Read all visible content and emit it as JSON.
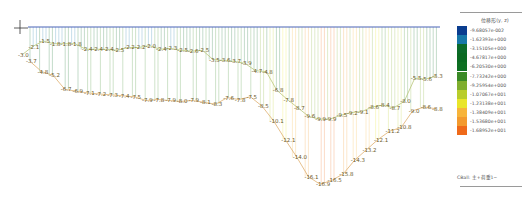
{
  "view": {
    "type": "structural-analysis-contour",
    "description": "Deformed shape / displacement diagram with value labels"
  },
  "legend": {
    "title": "位移形(y, z)",
    "entries": [
      {
        "value": "-9.68057e-002",
        "color": "#0a3d8f"
      },
      {
        "value": "-1.62393e+000",
        "color": "#1778a8"
      },
      {
        "value": "-3.15105e+000",
        "color": "#0b6b2a"
      },
      {
        "value": "-4.67817e+000",
        "color": "#0a6a22"
      },
      {
        "value": "-6.20530e+000",
        "color": "#0d6f22"
      },
      {
        "value": "-7.73242e+000",
        "color": "#3a8a26"
      },
      {
        "value": "-9.25954e+000",
        "color": "#7fae2e"
      },
      {
        "value": "-1.07067e+001",
        "color": "#b9cd2a"
      },
      {
        "value": "-1.23138e+001",
        "color": "#e9e52a"
      },
      {
        "value": "-1.38409e+001",
        "color": "#f7b43a"
      },
      {
        "value": "-1.53680e+001",
        "color": "#f39a2e"
      },
      {
        "value": "-1.68952e+001",
        "color": "#ef6a1a"
      }
    ],
    "footer": "CBall: 主+荷重1~"
  },
  "upper_curve_labels": [
    "-3.0",
    "-2.1",
    "-1.5",
    "-1.8",
    "-1.8",
    "-1.8",
    "-2.4",
    "-2.4",
    "-2.4",
    "-2.5",
    "-2.2",
    "-2.2",
    "-2.0",
    "-2.4",
    "-2.3",
    "-2.5",
    "-2.6",
    "-2.5",
    "-3.5",
    "-3.6",
    "-3.7",
    "-3.9",
    "-4.7",
    "-4.8",
    "-6.8",
    "-7.8",
    "-8.7",
    "-9.6",
    "-9.9",
    "-9.9",
    "-9.5",
    "-9.2",
    "-9.1",
    "-8.6",
    "-8.4",
    "-8.7",
    "-8.0",
    "-5.5",
    "-5.6",
    "-5.3"
  ],
  "lower_curve_labels": [
    "-3.7",
    "-4.8",
    "-5.2",
    "-6.7",
    "-6.9",
    "-7.1",
    "-7.2",
    "-7.3",
    "-7.4",
    "-7.5",
    "-7.9",
    "-7.8",
    "-7.9",
    "-8.0",
    "-7.9",
    "-8.1",
    "-8.3",
    "-7.6",
    "-7.8",
    "-7.5",
    "-8.5",
    "-10.1",
    "-12.1",
    "-14.0",
    "-16.1",
    "-16.9",
    "-16.5",
    "-15.8",
    "-14.3",
    "-13.2",
    "-12.1",
    "-11.2",
    "-10.8",
    "-9.0",
    "-8.6",
    "-8.8"
  ]
}
